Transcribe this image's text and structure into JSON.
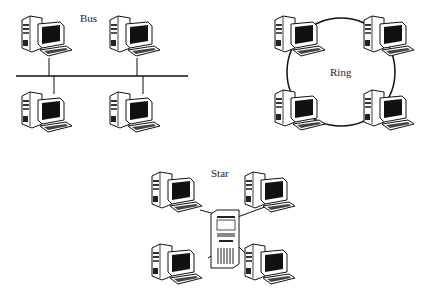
{
  "diagram": {
    "topologies": [
      {
        "id": "bus",
        "label": "Bus",
        "nodes": 4,
        "label_pos": [
          80,
          12
        ]
      },
      {
        "id": "ring",
        "label": "Ring",
        "nodes": 4,
        "label_pos": [
          330,
          66
        ]
      },
      {
        "id": "star",
        "label": "Star",
        "nodes": 4,
        "hub": "server",
        "label_pos": [
          210,
          168
        ]
      }
    ],
    "colors": {
      "line": "#111111",
      "background": "#ffffff"
    }
  }
}
